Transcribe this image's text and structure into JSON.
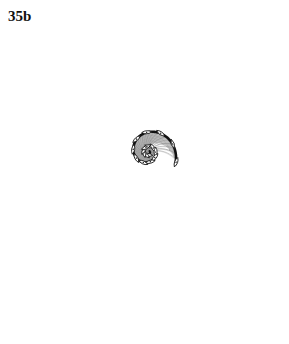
{
  "figure": {
    "plate_label": "35b",
    "label_x": 8,
    "label_y": 9,
    "background_color": "#ffffff",
    "ink_color": "#111111",
    "mesh_color": "#8a8a8a",
    "mesh_color_light": "#a9a9a9",
    "braid_color": "#777777",
    "canvas": {
      "width": 289,
      "height": 344
    }
  },
  "chart_data": {
    "type": "line",
    "title": "35b",
    "xlabel": "",
    "ylabel": "",
    "spiral": {
      "kind": "logarithmic",
      "center_x": 148,
      "center_y": 152,
      "a": 2.05,
      "b": 0.2065,
      "theta_start_deg": -40,
      "theta_end_deg": 760,
      "turns": 2.22
    },
    "series": [
      {
        "name": "outer-whorl-heavy-line",
        "role": "primary-spiral",
        "color": "#111111",
        "stroke_width": 2.6,
        "theta_start_deg": 58,
        "theta_end_deg": 745
      },
      {
        "name": "inner-whorl-heavy-line",
        "role": "umbilical-spiral",
        "color": "#111111",
        "stroke_width": 2.2,
        "theta_start_deg": -30,
        "theta_end_deg": 250
      },
      {
        "name": "braided-border",
        "role": "marginal-braid",
        "color": "#777777",
        "loop_count": 74,
        "strands": 2
      },
      {
        "name": "spiral-growth-lines",
        "role": "interior-mesh-spiral",
        "color": "#8a8a8a",
        "count": 26
      },
      {
        "name": "radial-ribs",
        "role": "interior-mesh-radial",
        "color": "#8a8a8a",
        "count": 64
      },
      {
        "name": "eye-whorls",
        "role": "protoconch-coil",
        "color": "#9a9a9a",
        "count": 34
      }
    ],
    "markers": {
      "name": "node-lens-marks",
      "shape": "lens",
      "count": 18,
      "color": "#111111",
      "note": "small pointed-oval nodes spaced along the heavy spiral where the braid crosses it"
    },
    "axis_ranges": {
      "x": [
        0,
        289
      ],
      "y": [
        0,
        344
      ]
    },
    "grid": false,
    "legend": false
  }
}
